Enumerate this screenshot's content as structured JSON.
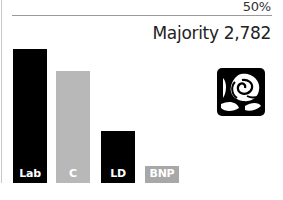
{
  "header": {
    "threshold_label": "50%",
    "majority_label": "Majority 2,782"
  },
  "icon": "labour-rose-icon",
  "colors": {
    "Lab": "#000000",
    "C": "#b8b8b8",
    "LD": "#000000",
    "BNP": "#a8a8a8"
  },
  "chart_data": {
    "type": "bar",
    "title": "Majority 2,782",
    "categories": [
      "Lab",
      "C",
      "LD",
      "BNP"
    ],
    "values": [
      46,
      40,
      19,
      5
    ],
    "annotations": [
      "50% reference line at top",
      "Majority 2,782"
    ],
    "xlabel": "",
    "ylabel": "Vote share (%)",
    "ylim": [
      0,
      50
    ],
    "grid": false,
    "legend": "none (labels inside bars)"
  },
  "bars": [
    {
      "label": "Lab",
      "left": 13,
      "height": 134,
      "color": "#000000"
    },
    {
      "label": "C",
      "left": 56,
      "height": 112,
      "color": "#b8b8b8"
    },
    {
      "label": "LD",
      "left": 101,
      "height": 52,
      "color": "#000000"
    },
    {
      "label": "BNP",
      "left": 145,
      "height": 17,
      "color": "#a8a8a8"
    }
  ]
}
